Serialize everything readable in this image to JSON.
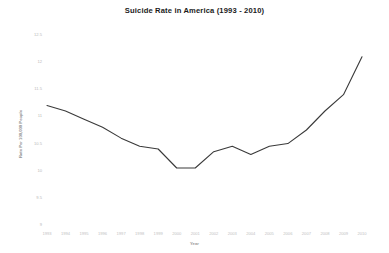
{
  "chart_data": {
    "type": "line",
    "title": "Suicide Rate in America (1993 - 2010)",
    "xlabel": "Year",
    "ylabel": "Rate Per 100,000 People",
    "x": [
      1993,
      1994,
      1995,
      1996,
      1997,
      1998,
      1999,
      2000,
      2001,
      2002,
      2003,
      2004,
      2005,
      2006,
      2007,
      2008,
      2009,
      2010
    ],
    "values": [
      11.2,
      11.1,
      10.95,
      10.8,
      10.6,
      10.45,
      10.4,
      10.05,
      10.05,
      10.35,
      10.45,
      10.3,
      10.45,
      10.5,
      10.75,
      11.1,
      11.4,
      12.1
    ],
    "categories": [
      "1993",
      "1994",
      "1995",
      "1996",
      "1997",
      "1998",
      "1999",
      "2000",
      "2001",
      "2002",
      "2003",
      "2004",
      "2005",
      "2006",
      "2007",
      "2008",
      "2009",
      "2010"
    ],
    "ylim": [
      9,
      12.5
    ],
    "xlim": [
      1993,
      2010
    ],
    "yticks": [
      12.5,
      12,
      11.5,
      11,
      10.5,
      10,
      9.5,
      9
    ],
    "ytick_labels": [
      "12.5",
      "12",
      "11.5",
      "11",
      "10.5",
      "10",
      "9.5",
      "9"
    ],
    "xtick_labels": [
      "1993",
      "1994",
      "1995",
      "1996",
      "1997",
      "1998",
      "1999",
      "2000",
      "2001",
      "2002",
      "2003",
      "2004",
      "2005",
      "2006",
      "2007",
      "2008",
      "2009",
      "2010"
    ],
    "grid": false,
    "legend": false,
    "series_color": "#3a3a3a",
    "line_width": 1.1,
    "background": "#ffffff"
  }
}
